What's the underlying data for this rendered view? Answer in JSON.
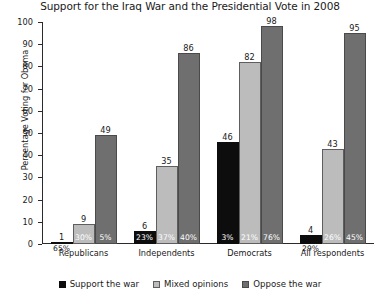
{
  "chart_data": {
    "type": "bar",
    "title": "Support for the Iraq War and the Presidential Vote in 2008",
    "xlabel": "",
    "ylabel": "Percentage Voting for Obama",
    "ylim": [
      0,
      100
    ],
    "yticks": [
      0,
      10,
      20,
      30,
      40,
      50,
      60,
      70,
      80,
      90,
      100
    ],
    "grid": false,
    "legend_position": "bottom",
    "categories": [
      "Republicans",
      "Independents",
      "Democrats",
      "All respondents"
    ],
    "series": [
      {
        "name": "Support the war",
        "color": "#0d0d0d",
        "values": [
          1,
          6,
          46,
          4
        ],
        "share_labels": [
          "65%",
          "23%",
          "3%",
          "29%"
        ]
      },
      {
        "name": "Mixed opinions",
        "color": "#bcbcbc",
        "values": [
          9,
          35,
          82,
          43
        ],
        "share_labels": [
          "30%",
          "37%",
          "21%",
          "26%"
        ]
      },
      {
        "name": "Oppose the war",
        "color": "#6f6f6f",
        "values": [
          49,
          86,
          98,
          95
        ],
        "share_labels": [
          "5%",
          "40%",
          "76%",
          "45%"
        ]
      }
    ]
  }
}
